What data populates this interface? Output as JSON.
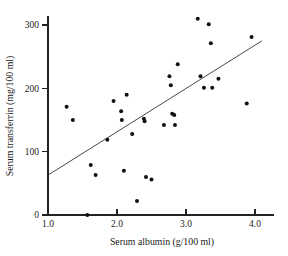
{
  "chart_data": {
    "type": "scatter",
    "title": "",
    "xlabel": "Serum albumin (g/100 ml)",
    "ylabel": "Serum transferrin (mg/100 ml)",
    "xlim": [
      1.0,
      4.3
    ],
    "ylim": [
      0,
      315
    ],
    "xticks": [
      1.0,
      2.0,
      3.0,
      4.0
    ],
    "xticklabels": [
      "1.0",
      "2.0",
      "3.0",
      "4.0"
    ],
    "yticks": [
      0,
      100,
      200,
      300
    ],
    "yticklabels": [
      "0",
      "100",
      "200",
      "300"
    ],
    "grid": false,
    "legend": null,
    "series": [
      {
        "name": "patients",
        "marker": "filled-circle",
        "marker_color": "#111111",
        "points": [
          [
            1.27,
            171
          ],
          [
            1.36,
            150
          ],
          [
            1.57,
            0
          ],
          [
            1.62,
            79
          ],
          [
            1.69,
            63
          ],
          [
            1.86,
            119
          ],
          [
            1.95,
            180
          ],
          [
            2.06,
            164
          ],
          [
            2.07,
            150
          ],
          [
            2.1,
            70
          ],
          [
            2.14,
            190
          ],
          [
            2.22,
            128
          ],
          [
            2.29,
            22
          ],
          [
            2.39,
            152
          ],
          [
            2.4,
            148
          ],
          [
            2.42,
            60
          ],
          [
            2.5,
            56
          ],
          [
            2.68,
            142
          ],
          [
            2.76,
            219
          ],
          [
            2.78,
            205
          ],
          [
            2.8,
            160
          ],
          [
            2.83,
            158
          ],
          [
            2.84,
            142
          ],
          [
            2.88,
            238
          ],
          [
            3.17,
            310
          ],
          [
            3.21,
            219
          ],
          [
            3.26,
            201
          ],
          [
            3.33,
            301
          ],
          [
            3.36,
            271
          ],
          [
            3.38,
            201
          ],
          [
            3.47,
            215
          ],
          [
            3.88,
            176
          ],
          [
            3.95,
            281
          ]
        ]
      }
    ],
    "fit_line": {
      "name": "regression-line",
      "x_start": 1.0,
      "y_start": 63,
      "x_end": 4.1,
      "y_end": 275,
      "color": "#333333"
    }
  },
  "axes": {
    "x_title": "Serum albumin (g/100 ml)",
    "y_title": "Serum transferrin (mg/100 ml)"
  }
}
